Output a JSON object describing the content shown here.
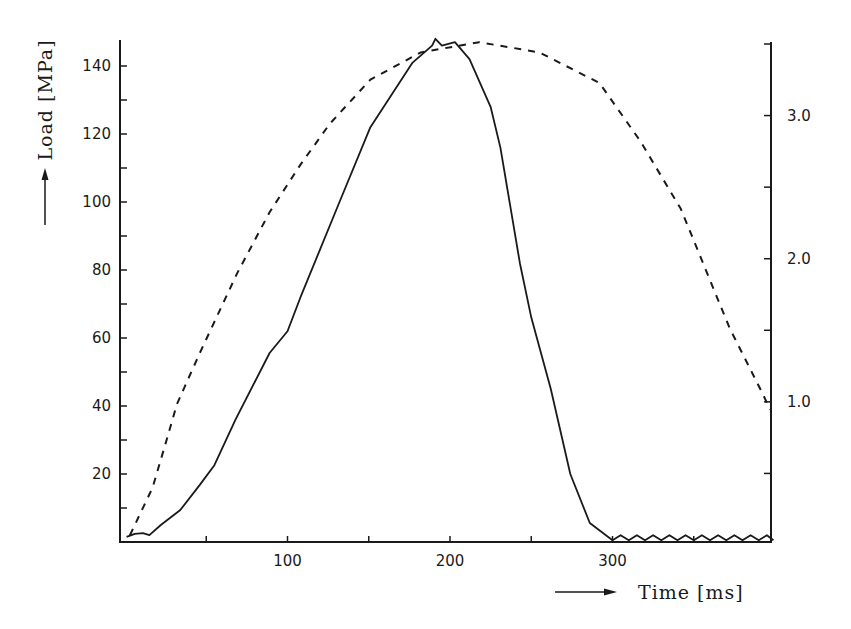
{
  "chart_data": {
    "type": "line",
    "title": "",
    "xlabel": "Time [ms]",
    "ylabel": "Load [MPa]",
    "y2label": "",
    "xlim": [
      0,
      400
    ],
    "ylim": [
      0,
      148
    ],
    "y2lim": [
      0,
      3.5
    ],
    "grid": false,
    "legend": null,
    "x_ticks": [
      {
        "value": 50,
        "label": ""
      },
      {
        "value": 100,
        "label": "100"
      },
      {
        "value": 150,
        "label": ""
      },
      {
        "value": 200,
        "label": "200"
      },
      {
        "value": 250,
        "label": ""
      },
      {
        "value": 300,
        "label": "300"
      },
      {
        "value": 350,
        "label": ""
      }
    ],
    "y_ticks": [
      {
        "value": 10,
        "label": ""
      },
      {
        "value": 20,
        "label": "20"
      },
      {
        "value": 30,
        "label": ""
      },
      {
        "value": 40,
        "label": "40"
      },
      {
        "value": 50,
        "label": ""
      },
      {
        "value": 60,
        "label": "60"
      },
      {
        "value": 70,
        "label": ""
      },
      {
        "value": 80,
        "label": "80"
      },
      {
        "value": 90,
        "label": ""
      },
      {
        "value": 100,
        "label": "100"
      },
      {
        "value": 110,
        "label": ""
      },
      {
        "value": 120,
        "label": "120"
      },
      {
        "value": 130,
        "label": ""
      },
      {
        "value": 140,
        "label": "140"
      }
    ],
    "y2_ticks": [
      {
        "value": 0.5,
        "label": ""
      },
      {
        "value": 1.0,
        "label": "1.0"
      },
      {
        "value": 1.5,
        "label": ""
      },
      {
        "value": 2.0,
        "label": "2.0"
      },
      {
        "value": 2.5,
        "label": ""
      },
      {
        "value": 3.0,
        "label": "3.0"
      },
      {
        "value": 3.5,
        "label": ""
      }
    ],
    "series": [
      {
        "name": "Load (solid)",
        "style": "solid",
        "axis": "left",
        "x": [
          1,
          6,
          11,
          15,
          22,
          34,
          46,
          55,
          68,
          89,
          100,
          108,
          132,
          151,
          177,
          189,
          191,
          195,
          203,
          212,
          225,
          231,
          243,
          250,
          262,
          274,
          286,
          300,
          305,
          310,
          315,
          320,
          325,
          330,
          335,
          340,
          345,
          350,
          355,
          360,
          365,
          370,
          375,
          380,
          385,
          390,
          395,
          399
        ],
        "values": [
          1.5,
          2.4,
          2.6,
          2.0,
          5.0,
          9.4,
          16.8,
          22.6,
          36,
          55.6,
          62,
          72,
          100,
          122,
          141,
          146,
          148,
          146,
          147,
          142,
          128,
          116,
          82,
          66,
          45,
          20,
          5.6,
          0.5,
          2,
          0.5,
          2,
          0.5,
          2,
          0.5,
          2,
          0.5,
          2,
          0.5,
          2,
          0.5,
          2,
          0.5,
          2,
          0.5,
          2,
          0.5,
          2,
          0.5
        ]
      },
      {
        "name": "Second quantity (dashed)",
        "style": "dashed",
        "axis": "left",
        "x": [
          3,
          17,
          25,
          32,
          46,
          69,
          89,
          108,
          126,
          151,
          182,
          218,
          255,
          292,
          317,
          342,
          372,
          392,
          397
        ],
        "values": [
          2,
          16,
          29,
          40.6,
          55.6,
          79,
          97,
          111,
          123,
          136,
          144,
          147,
          144,
          135,
          118,
          98,
          63,
          44,
          39
        ]
      }
    ]
  },
  "labels": {
    "y_axis_title": "Load [MPa]",
    "x_axis_title": "Time [ms]"
  }
}
